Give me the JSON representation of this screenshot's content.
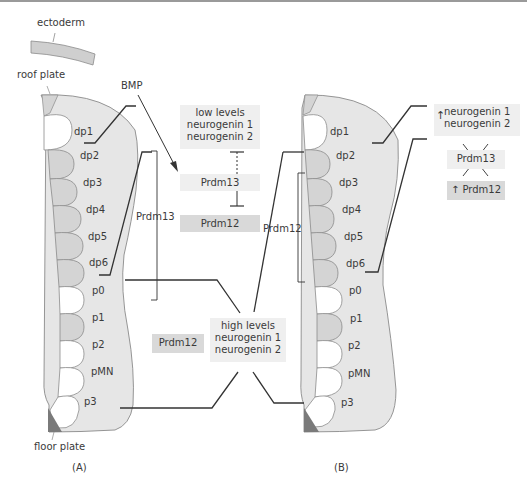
{
  "panelA": {
    "label": "(A)",
    "ectoderm": "ectoderm",
    "roof_plate": "roof plate",
    "floor_plate": "floor plate",
    "bmp": "BMP",
    "domains": [
      "dp1",
      "dp2",
      "dp3",
      "dp4",
      "dp5",
      "dp6",
      "p0",
      "p1",
      "p2",
      "pMN",
      "p3"
    ],
    "bracket_label": "Prdm13",
    "low_box": [
      "low levels",
      "neurogenin 1",
      "neurogenin 2"
    ],
    "prdm13_box": "Prdm13",
    "prdm12_box": "Prdm12",
    "side_prdm12": "Prdm12"
  },
  "center": {
    "high_box": [
      "high levels",
      "neurogenin 1",
      "neurogenin 2"
    ]
  },
  "panelB": {
    "label": "(B)",
    "domains": [
      "dp1",
      "dp2",
      "dp3",
      "dp4",
      "dp5",
      "dp6",
      "p0",
      "p1",
      "p2",
      "pMN",
      "p3"
    ],
    "bracket_label": "Prdm12",
    "up_box": [
      "neurogenin 1",
      "neurogenin 2"
    ],
    "crossed_box": "Prdm13",
    "up_prdm12": "Prdm12",
    "arrow_up": "↑"
  },
  "colors": {
    "tube_fill": "#e6e6e6",
    "domain_grey": "#d4d4d4",
    "domain_white": "#ffffff",
    "outline": "#8a8a8a",
    "line": "#333333",
    "floor_plate": "#7a7a7a",
    "box_light": "#efefef",
    "box_dark": "#d9d9d9"
  }
}
